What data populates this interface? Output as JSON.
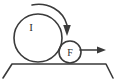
{
  "figure": {
    "type": "mechanics-diagram",
    "background_color": "#ffffff",
    "stroke_color": "#3a3a3a",
    "label_color": "#2e2e2e",
    "labels": {
      "large_disk": "I",
      "small_disk": "F"
    },
    "large_disk": {
      "name": "large-disk",
      "center_x": 38,
      "center_y": 38,
      "radius": 24,
      "label": "I",
      "label_x": 31,
      "label_y": 27,
      "font_size": 11
    },
    "small_disk": {
      "name": "small-disk",
      "center_x": 70,
      "center_y": 52,
      "radius": 11,
      "label": "F",
      "label_x": 70,
      "label_y": 52,
      "font_size": 10
    },
    "curved_arrow": {
      "name": "clockwise-rotation-arrow",
      "direction": "clockwise",
      "path": "M 32 5 C 48 2 62 10 67 26",
      "head_x": 67,
      "head_y": 35,
      "head_width": 8,
      "head_height": 10
    },
    "force_arrow": {
      "name": "force-arrow",
      "direction": "right",
      "x_start": 80,
      "x_end": 97,
      "y": 50,
      "head_x": 105,
      "head_width": 8,
      "head_height": 7
    },
    "ground": {
      "name": "ground-support",
      "surface_y": 64,
      "surface_x_start": 12,
      "surface_x_end": 106,
      "left_foot_x": 3,
      "right_foot_x": 113,
      "foot_y": 78
    }
  }
}
